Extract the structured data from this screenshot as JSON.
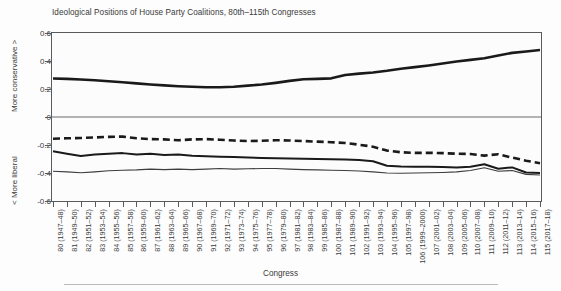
{
  "chart_data": {
    "type": "line",
    "title": "Ideological Positions of House Party Coalitions, 80th–115th Congresses",
    "xlabel": "Congress",
    "ylabel_top": "More conservative >",
    "ylabel_bottom": "< More liberal",
    "ylim": [
      -0.6,
      0.6
    ],
    "yticks": [
      "0.6",
      "0.4",
      "0.2",
      "0",
      "-0.2",
      "-0.4",
      "-0.6"
    ],
    "ytick_values": [
      0.6,
      0.4,
      0.2,
      0,
      -0.2,
      -0.4,
      -0.6
    ],
    "grid": false,
    "zero_line": true,
    "legend_position": "none",
    "categories": [
      "80 (1947–48)",
      "81 (1949–50)",
      "82 (1951–52)",
      "83 (1953–54)",
      "84 (1955–56)",
      "85 (1957–58)",
      "86 (1959–60)",
      "87 (1961–62)",
      "88 (1963–64)",
      "89 (1965–66)",
      "90 (1967–68)",
      "91 (1969–70)",
      "92 (1971–72)",
      "93 (1973–74)",
      "94 (1975–76)",
      "95 (1977–78)",
      "96 (1979–80)",
      "97 (1981–82)",
      "98 (1983–84)",
      "99 (1985–86)",
      "100 (1987–88)",
      "101 (1989–90)",
      "102 (1991–92)",
      "103 (1993–94)",
      "104 (1995–96)",
      "105 (1997–98)",
      "106 (1999–2000)",
      "107 (2001–02)",
      "108 (2003–04)",
      "109 (2005–06)",
      "110 (2007–08)",
      "111 (2009–10)",
      "112 (2011–12)",
      "113 (2013–14)",
      "114 (2015–16)",
      "115 (2017–18)"
    ],
    "series": [
      {
        "name": "Republicans",
        "style": "solid-thick",
        "color": "#1a1a1a",
        "width": 2.6,
        "values": [
          0.275,
          0.272,
          0.268,
          0.262,
          0.255,
          0.248,
          0.24,
          0.232,
          0.226,
          0.22,
          0.216,
          0.212,
          0.212,
          0.216,
          0.224,
          0.232,
          0.244,
          0.258,
          0.27,
          0.272,
          0.276,
          0.3,
          0.31,
          0.318,
          0.33,
          0.345,
          0.356,
          0.368,
          0.382,
          0.396,
          0.408,
          0.42,
          0.44,
          0.458,
          0.468,
          0.478
        ]
      },
      {
        "name": "Northern Democrats",
        "style": "dashed",
        "color": "#1a1a1a",
        "width": 2.6,
        "values": [
          -0.155,
          -0.152,
          -0.15,
          -0.146,
          -0.142,
          -0.14,
          -0.152,
          -0.158,
          -0.16,
          -0.166,
          -0.16,
          -0.158,
          -0.162,
          -0.168,
          -0.172,
          -0.17,
          -0.166,
          -0.168,
          -0.172,
          -0.176,
          -0.18,
          -0.186,
          -0.198,
          -0.212,
          -0.24,
          -0.252,
          -0.256,
          -0.256,
          -0.258,
          -0.262,
          -0.264,
          -0.276,
          -0.266,
          -0.29,
          -0.312,
          -0.33
        ]
      },
      {
        "name": "All Democrats",
        "style": "solid-medium",
        "color": "#1a1a1a",
        "width": 2.0,
        "values": [
          -0.245,
          -0.262,
          -0.278,
          -0.268,
          -0.262,
          -0.258,
          -0.268,
          -0.262,
          -0.272,
          -0.268,
          -0.276,
          -0.28,
          -0.284,
          -0.286,
          -0.29,
          -0.292,
          -0.294,
          -0.296,
          -0.298,
          -0.3,
          -0.302,
          -0.304,
          -0.308,
          -0.316,
          -0.348,
          -0.354,
          -0.356,
          -0.356,
          -0.358,
          -0.36,
          -0.356,
          -0.338,
          -0.37,
          -0.36,
          -0.396,
          -0.4
        ]
      },
      {
        "name": "Southern Democrats",
        "style": "solid-thin",
        "color": "#3d3d3d",
        "width": 1.1,
        "values": [
          -0.388,
          -0.392,
          -0.398,
          -0.392,
          -0.384,
          -0.38,
          -0.378,
          -0.372,
          -0.376,
          -0.372,
          -0.376,
          -0.372,
          -0.368,
          -0.372,
          -0.37,
          -0.368,
          -0.368,
          -0.372,
          -0.376,
          -0.378,
          -0.38,
          -0.382,
          -0.386,
          -0.392,
          -0.4,
          -0.402,
          -0.4,
          -0.398,
          -0.396,
          -0.392,
          -0.382,
          -0.362,
          -0.388,
          -0.382,
          -0.41,
          -0.414
        ]
      }
    ]
  }
}
